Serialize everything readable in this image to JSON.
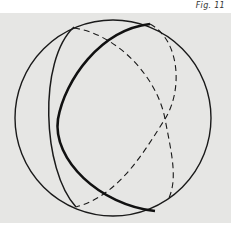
{
  "figure": {
    "caption": "Fig. 11",
    "colors": {
      "background": "#e6e6e4",
      "stroke": "#1a1a1a"
    }
  }
}
